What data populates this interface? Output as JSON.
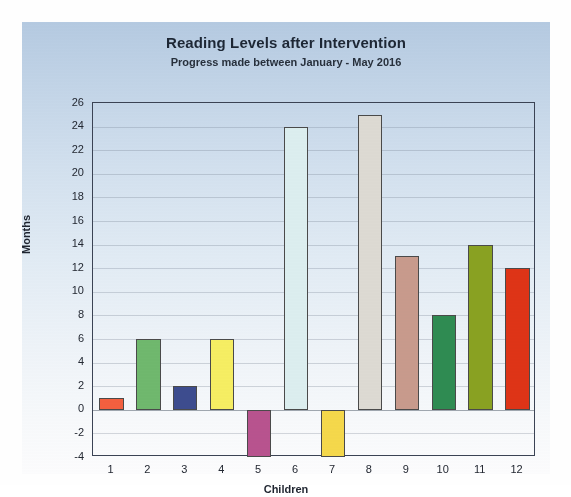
{
  "chart_data": {
    "type": "bar",
    "title": "Reading Levels after Intervention",
    "subtitle": "Progress made between January - May 2016",
    "xlabel": "Children",
    "ylabel": "Months",
    "categories": [
      "1",
      "2",
      "3",
      "4",
      "5",
      "6",
      "7",
      "8",
      "9",
      "10",
      "11",
      "12"
    ],
    "values": [
      1,
      6,
      2,
      6,
      -4,
      24,
      -4,
      25,
      13,
      8,
      14,
      12
    ],
    "ylim": [
      -4,
      26
    ],
    "ytick_step": 2,
    "yticks": [
      "26",
      "24",
      "22",
      "20",
      "18",
      "16",
      "14",
      "12",
      "10",
      "8",
      "6",
      "4",
      "2",
      "0",
      "-2",
      "-4"
    ],
    "grid": true,
    "legend": "none",
    "bar_colors": [
      "#f4603f",
      "#70b96e",
      "#3d4c8f",
      "#f7ef63",
      "#b9538f",
      "#ddeff0",
      "#f6d94b",
      "#dedbd4",
      "#c99b8d",
      "#2f8c52",
      "#8aa222",
      "#df3417"
    ],
    "bar_border_color": "#4a4a4a",
    "series": [
      {
        "name": "Progress in months",
        "values": [
          1,
          6,
          2,
          6,
          -4,
          24,
          -4,
          25,
          13,
          8,
          14,
          12
        ]
      }
    ]
  },
  "style": {
    "panel_top_color": "#b6cbe2",
    "panel_bottom_color": "#fdfdfe",
    "axis_color": "#3b4354",
    "text_color": "#232832"
  }
}
